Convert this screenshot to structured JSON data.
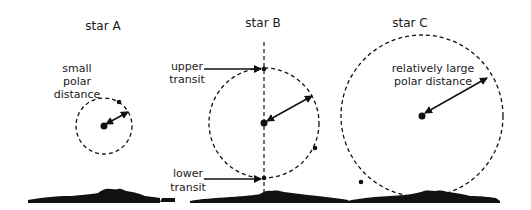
{
  "diagram": {
    "colors": {
      "ink": "#111111",
      "background": "#ffffff"
    },
    "stars": [
      {
        "id": "A",
        "title": "star A",
        "annotation_lines": [
          "small",
          "polar",
          "distance"
        ],
        "circle": {
          "cx": 104,
          "cy": 126,
          "r": 28
        }
      },
      {
        "id": "B",
        "title": "star B",
        "circle": {
          "cx": 264,
          "cy": 123,
          "r": 56
        },
        "upper_transit_lines": [
          "upper",
          "transit"
        ],
        "lower_transit_lines": [
          "lower",
          "transit"
        ]
      },
      {
        "id": "C",
        "title": "star C",
        "annotation_lines": [
          "relatively large",
          "polar distance"
        ],
        "circle": {
          "cx": 422,
          "cy": 116,
          "r": 82
        }
      }
    ]
  }
}
